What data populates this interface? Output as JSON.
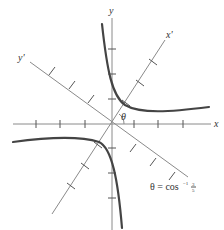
{
  "figure": {
    "type": "rotated-axes-hyperbola",
    "axes": {
      "x_label": "x",
      "y_label": "y",
      "x_prime_label": "x'",
      "y_prime_label": "y'"
    },
    "angle_label": "θ",
    "equation": {
      "lhs": "θ = cos",
      "superscript": "−1",
      "frac_num": "3",
      "frac_den": "5"
    },
    "ticks_per_half_axis": 3,
    "colors": {
      "axis": "#8a8a8a",
      "curve": "#444444",
      "text": "#333333"
    }
  }
}
